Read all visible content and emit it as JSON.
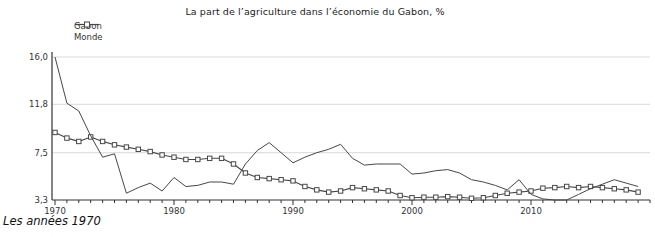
{
  "title": "La part de l’agriculture dans l’économie du Gabon, %",
  "caption": "Les années 1970",
  "legend": [
    {
      "label": "Gabon",
      "marker": "line"
    },
    {
      "label": "Monde",
      "marker": "line-square"
    }
  ],
  "colors": {
    "line": "#474747",
    "marker_fill": "#ffffff",
    "grid": "#d9d9d9",
    "axis": "#333333",
    "text": "#333333",
    "background": "#ffffff"
  },
  "chart_data": {
    "type": "line",
    "title": "La part de l’agriculture dans l’économie du Gabon, %",
    "xlabel": "",
    "ylabel": "",
    "grid": true,
    "legend_position": "top-left",
    "xlim": [
      1970,
      2020
    ],
    "ylim": [
      3.3,
      16.0
    ],
    "yticks": [
      {
        "value": 16.0,
        "label": "16,0"
      },
      {
        "value": 11.8,
        "label": "11,8"
      },
      {
        "value": 7.5,
        "label": "7,5"
      },
      {
        "value": 3.3,
        "label": "3,3"
      }
    ],
    "xticks_labeled": [
      1970,
      1980,
      1990,
      2000,
      2010
    ],
    "x": [
      1970,
      1971,
      1972,
      1973,
      1974,
      1975,
      1976,
      1977,
      1978,
      1979,
      1980,
      1981,
      1982,
      1983,
      1984,
      1985,
      1986,
      1987,
      1988,
      1989,
      1990,
      1991,
      1992,
      1993,
      1994,
      1995,
      1996,
      1997,
      1998,
      1999,
      2000,
      2001,
      2002,
      2003,
      2004,
      2005,
      2006,
      2007,
      2008,
      2009,
      2010,
      2011,
      2012,
      2013,
      2014,
      2015,
      2016,
      2017,
      2018,
      2019
    ],
    "series": [
      {
        "name": "Gabon",
        "marker": "none",
        "values": [
          16.0,
          11.9,
          11.2,
          9.0,
          7.1,
          7.4,
          3.9,
          4.4,
          4.8,
          4.1,
          5.3,
          4.5,
          4.6,
          4.9,
          4.9,
          4.7,
          6.5,
          7.7,
          8.4,
          7.5,
          6.6,
          7.1,
          7.5,
          7.8,
          8.25,
          7.0,
          6.4,
          6.5,
          6.5,
          6.5,
          5.6,
          5.7,
          5.9,
          6.0,
          5.7,
          5.1,
          4.9,
          4.6,
          4.2,
          5.1,
          3.8,
          3.4,
          3.3,
          3.3,
          3.8,
          4.3,
          4.7,
          5.1,
          4.8,
          4.5
        ]
      },
      {
        "name": "Monde",
        "marker": "square",
        "values": [
          9.3,
          8.8,
          8.5,
          8.9,
          8.5,
          8.2,
          8.0,
          7.8,
          7.6,
          7.3,
          7.1,
          6.9,
          6.9,
          7.0,
          7.0,
          6.5,
          5.7,
          5.3,
          5.2,
          5.1,
          5.0,
          4.5,
          4.2,
          4.0,
          4.1,
          4.4,
          4.3,
          4.2,
          4.1,
          3.7,
          3.5,
          3.55,
          3.55,
          3.6,
          3.55,
          3.45,
          3.5,
          3.7,
          3.9,
          4.0,
          4.1,
          4.35,
          4.4,
          4.5,
          4.4,
          4.5,
          4.4,
          4.3,
          4.2,
          4.0
        ]
      }
    ]
  }
}
